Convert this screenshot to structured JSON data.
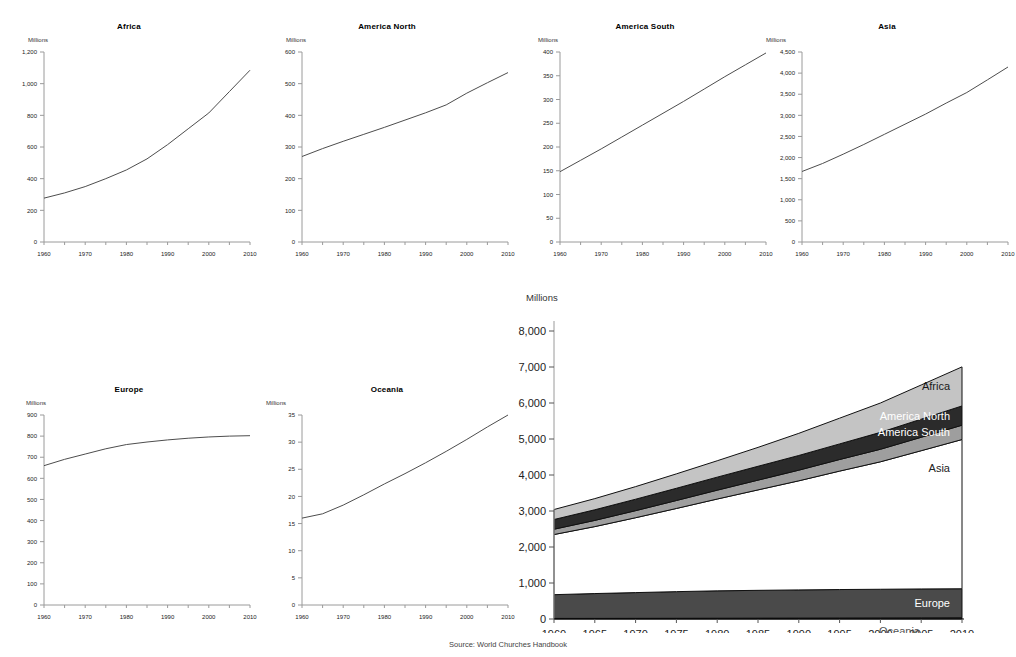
{
  "source_note": "Source: World Churches Handbook",
  "units_label": "Millions",
  "small_charts": [
    {
      "name": "africa",
      "title": "Africa",
      "units": "Millions",
      "yticks": [
        0,
        200,
        400,
        600,
        800,
        1000,
        1200
      ],
      "yticklabels": [
        "0",
        "200",
        "400",
        "600",
        "800",
        "1,000",
        "1,200"
      ],
      "ylim": [
        0,
        1200
      ],
      "xticks": [
        1960,
        1970,
        1980,
        1990,
        2000,
        2010
      ],
      "xticklabels": [
        "1960",
        "1970",
        "1980",
        "1990",
        "2000",
        "2010"
      ],
      "xlim": [
        1960,
        2010
      ],
      "x": [
        1960,
        1965,
        1970,
        1975,
        1980,
        1985,
        1990,
        1995,
        2000,
        2005,
        2010
      ],
      "y": [
        277,
        310,
        350,
        400,
        455,
        525,
        615,
        715,
        815,
        950,
        1085
      ]
    },
    {
      "name": "america-north",
      "title": "America North",
      "units": "Millions",
      "yticks": [
        0,
        100,
        200,
        300,
        400,
        500,
        600
      ],
      "yticklabels": [
        "0",
        "100",
        "200",
        "300",
        "400",
        "500",
        "600"
      ],
      "ylim": [
        0,
        600
      ],
      "xticks": [
        1960,
        1970,
        1980,
        1990,
        2000,
        2010
      ],
      "xticklabels": [
        "1960",
        "1970",
        "1980",
        "1990",
        "2000",
        "2010"
      ],
      "xlim": [
        1960,
        2010
      ],
      "x": [
        1960,
        1965,
        1970,
        1975,
        1980,
        1985,
        1990,
        1995,
        2000,
        2005,
        2010
      ],
      "y": [
        270,
        295,
        318,
        340,
        362,
        385,
        408,
        433,
        470,
        503,
        535
      ]
    },
    {
      "name": "america-south",
      "title": "America South",
      "units": "Millions",
      "yticks": [
        0,
        50,
        100,
        150,
        200,
        250,
        300,
        350,
        400
      ],
      "yticklabels": [
        "0",
        "50",
        "100",
        "150",
        "200",
        "250",
        "300",
        "350",
        "400"
      ],
      "ylim": [
        0,
        400
      ],
      "xticks": [
        1960,
        1970,
        1980,
        1990,
        2000,
        2010
      ],
      "xticklabels": [
        "1960",
        "1970",
        "1980",
        "1990",
        "2000",
        "2010"
      ],
      "xlim": [
        1960,
        2010
      ],
      "x": [
        1960,
        1965,
        1970,
        1975,
        1980,
        1985,
        1990,
        1995,
        2000,
        2005,
        2010
      ],
      "y": [
        148,
        172,
        196,
        221,
        246,
        271,
        296,
        322,
        348,
        373,
        398
      ]
    },
    {
      "name": "asia",
      "title": "Asia",
      "units": "Millions",
      "yticks": [
        0,
        500,
        1000,
        1500,
        2000,
        2500,
        3000,
        3500,
        4000,
        4500
      ],
      "yticklabels": [
        "0",
        "500",
        "1,000",
        "1,500",
        "2,000",
        "2,500",
        "3,000",
        "3,500",
        "4,000",
        "4,500"
      ],
      "ylim": [
        0,
        4500
      ],
      "xticks": [
        1960,
        1970,
        1980,
        1990,
        2000,
        2010
      ],
      "xticklabels": [
        "1960",
        "1970",
        "1980",
        "1990",
        "2000",
        "2010"
      ],
      "xlim": [
        1960,
        2010
      ],
      "x": [
        1960,
        1965,
        1970,
        1975,
        1980,
        1985,
        1990,
        1995,
        2000,
        2005,
        2010
      ],
      "y": [
        1670,
        1860,
        2080,
        2310,
        2550,
        2790,
        3030,
        3290,
        3540,
        3840,
        4145
      ]
    },
    {
      "name": "europe",
      "title": "Europe",
      "units": "Millions",
      "yticks": [
        0,
        100,
        200,
        300,
        400,
        500,
        600,
        700,
        800,
        900
      ],
      "yticklabels": [
        "0",
        "100",
        "200",
        "300",
        "400",
        "500",
        "600",
        "700",
        "800",
        "900"
      ],
      "ylim": [
        0,
        900
      ],
      "xticks": [
        1960,
        1970,
        1980,
        1990,
        2000,
        2010
      ],
      "xticklabels": [
        "1960",
        "1970",
        "1980",
        "1990",
        "2000",
        "2010"
      ],
      "xlim": [
        1960,
        2010
      ],
      "x": [
        1960,
        1965,
        1970,
        1975,
        1980,
        1985,
        1990,
        1995,
        2000,
        2005,
        2010
      ],
      "y": [
        660,
        690,
        715,
        740,
        760,
        772,
        782,
        790,
        796,
        800,
        802
      ]
    },
    {
      "name": "oceania",
      "title": "Oceania",
      "units": "Millions",
      "yticks": [
        0,
        5,
        10,
        15,
        20,
        25,
        30,
        35
      ],
      "yticklabels": [
        "0",
        "5",
        "10",
        "15",
        "20",
        "25",
        "30",
        "35"
      ],
      "ylim": [
        0,
        35
      ],
      "xticks": [
        1960,
        1970,
        1980,
        1990,
        2000,
        2010
      ],
      "xticklabels": [
        "1960",
        "1970",
        "1980",
        "1990",
        "2000",
        "2010"
      ],
      "xlim": [
        1960,
        2010
      ],
      "x": [
        1960,
        1965,
        1970,
        1975,
        1980,
        1985,
        1990,
        1995,
        2000,
        2005,
        2010
      ],
      "y": [
        16.0,
        16.8,
        18.4,
        20.3,
        22.3,
        24.2,
        26.2,
        28.3,
        30.5,
        32.8,
        35.0
      ]
    }
  ],
  "chart_data": {
    "type": "area",
    "title": "",
    "subtitle": "",
    "xlabel": "",
    "ylabel": "Millions",
    "units_label": "Millions",
    "stacked": true,
    "grid": false,
    "legend_position": "inline-right",
    "xlim": [
      1960,
      2010
    ],
    "ylim": [
      0,
      8000
    ],
    "yticks": [
      0,
      1000,
      2000,
      3000,
      4000,
      5000,
      6000,
      7000,
      8000
    ],
    "yticklabels": [
      "0",
      "1,000",
      "2,000",
      "3,000",
      "4,000",
      "5,000",
      "6,000",
      "7,000",
      "8,000"
    ],
    "xticks": [
      1960,
      1965,
      1970,
      1975,
      1980,
      1985,
      1990,
      1995,
      2000,
      2005,
      2010
    ],
    "xticklabels": [
      "1960",
      "1965",
      "1970",
      "1975",
      "1980",
      "1985",
      "1990",
      "1995",
      "2000",
      "2005",
      "2010"
    ],
    "x": [
      1960,
      1965,
      1970,
      1975,
      1980,
      1985,
      1990,
      1995,
      2000,
      2005,
      2010
    ],
    "stack_order_bottom_to_top": [
      "Oceania",
      "Europe",
      "Asia",
      "America South",
      "America North",
      "Africa"
    ],
    "series": [
      {
        "name": "Oceania",
        "fill": "#4a4a4a",
        "label_color": "#555555",
        "label_inside": false,
        "values": [
          16.0,
          16.8,
          18.4,
          20.3,
          22.3,
          24.2,
          26.2,
          28.3,
          30.5,
          32.8,
          35.0
        ]
      },
      {
        "name": "Europe",
        "fill": "#4a4a4a",
        "label_color": "#ffffff",
        "label_inside": true,
        "values": [
          660,
          690,
          715,
          740,
          760,
          772,
          782,
          790,
          796,
          802,
          805
        ]
      },
      {
        "name": "Asia",
        "fill": "#ffffff",
        "label_color": "#222222",
        "label_inside": true,
        "values": [
          1670,
          1860,
          2080,
          2310,
          2550,
          2790,
          3030,
          3290,
          3540,
          3840,
          4145
        ]
      },
      {
        "name": "America South",
        "fill": "#9e9e9e",
        "label_color": "#ffffff",
        "label_inside": true,
        "values": [
          148,
          172,
          196,
          221,
          246,
          271,
          296,
          322,
          348,
          373,
          398
        ]
      },
      {
        "name": "America North",
        "fill": "#2b2b2b",
        "label_color": "#ffffff",
        "label_inside": true,
        "values": [
          270,
          295,
          318,
          340,
          362,
          385,
          408,
          433,
          470,
          503,
          535
        ]
      },
      {
        "name": "Africa",
        "fill": "#c4c4c4",
        "label_color": "#1a1a1a",
        "label_inside": true,
        "values": [
          277,
          310,
          350,
          400,
          455,
          525,
          615,
          715,
          815,
          950,
          1085
        ]
      }
    ],
    "totals": [
      3041,
      3344,
      3677,
      4031,
      4395,
      4767,
      5157,
      5578,
      6000,
      6501,
      7003
    ]
  }
}
